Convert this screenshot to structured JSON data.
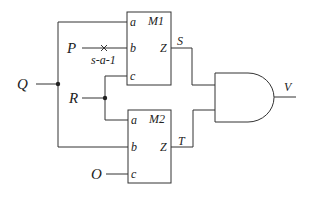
{
  "diagram": {
    "type": "logic-circuit",
    "inputs": {
      "Q": "Q",
      "P": "P",
      "R": "R",
      "O": "O"
    },
    "fault_label": "s-a-1",
    "modules": [
      {
        "name": "M1",
        "pins": {
          "a": "a",
          "b": "b",
          "c": "c",
          "z": "Z"
        },
        "output": "S"
      },
      {
        "name": "M2",
        "pins": {
          "a": "a",
          "b": "b",
          "c": "c",
          "z": "Z"
        },
        "output": "T"
      }
    ],
    "gate": {
      "type": "AND",
      "output": "V"
    },
    "colors": {
      "line": "#333333",
      "text": "#222222",
      "background": "#ffffff"
    }
  }
}
